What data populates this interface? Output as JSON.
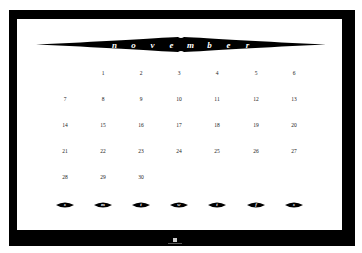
{
  "calendar": {
    "month_letters": [
      "n",
      "o",
      "v",
      "e",
      "m",
      "b",
      "e",
      "r"
    ],
    "month": "november",
    "weeks": [
      [
        "",
        "1",
        "2",
        "3",
        "4",
        "5",
        "6"
      ],
      [
        "7",
        "8",
        "9",
        "10",
        "11",
        "12",
        "13"
      ],
      [
        "14",
        "15",
        "16",
        "17",
        "18",
        "19",
        "20"
      ],
      [
        "21",
        "22",
        "23",
        "24",
        "25",
        "26",
        "27"
      ],
      [
        "28",
        "29",
        "30",
        "",
        "",
        "",
        ""
      ]
    ],
    "day_labels": [
      "s",
      "m",
      "t",
      "w",
      "t",
      "f",
      "s"
    ]
  },
  "colors": {
    "frame": "#000000",
    "sheet": "#ffffff",
    "text": "#222222"
  }
}
